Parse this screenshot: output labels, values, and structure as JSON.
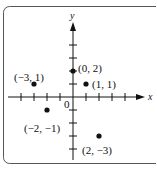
{
  "chart_data": {
    "type": "scatter",
    "title": "",
    "xlabel": "x",
    "ylabel": "y",
    "origin_label": "0",
    "xlim": [
      -5,
      5
    ],
    "ylim": [
      -4,
      4
    ],
    "grid": false,
    "x_ticks": [
      -4,
      -3,
      -2,
      -1,
      1,
      2,
      3,
      4
    ],
    "y_ticks": [
      -4,
      -3,
      -2,
      -1,
      1,
      2,
      3,
      4
    ],
    "points": [
      {
        "x": -3,
        "y": 1,
        "label": "(−3, 1)"
      },
      {
        "x": 0,
        "y": 2,
        "label": "(0, 2)"
      },
      {
        "x": 1,
        "y": 1,
        "label": "(1, 1)"
      },
      {
        "x": -2,
        "y": -1,
        "label": "(−2, −1)"
      },
      {
        "x": 2,
        "y": -3,
        "label": "(2, −3)"
      }
    ]
  },
  "colors": {
    "ink": "#111111",
    "frame": "#555555",
    "background": "#ffffff"
  }
}
